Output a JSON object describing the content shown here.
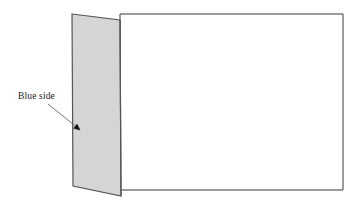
{
  "figure": {
    "type": "line-diagram",
    "canvas": {
      "width": 360,
      "height": 210,
      "background": "#ffffff"
    },
    "colors": {
      "background": "#ffffff",
      "panel_fill": "#d5d5d5",
      "panel_stroke": "#555555",
      "sheet_fill": "#ffffff",
      "sheet_stroke": "#3a3a3a",
      "leader_line": "#6b6b6b",
      "arrow_head": "#101010",
      "text": "#1a1a1a"
    },
    "shapes": {
      "sheet": {
        "name": "right-sheet",
        "description": "Large white rectangle lying flat",
        "points": "120,14 343,14 343,190 120,190",
        "fill": "#ffffff",
        "stroke": "#3a3a3a",
        "stroke_width": 1
      },
      "panel": {
        "name": "left-panel",
        "description": "Shaded upright flap hinged along the right edge",
        "points": "72,14 120,20 121,196 73,186",
        "fill": "#d5d5d5",
        "stroke": "#555555",
        "stroke_width": 1.2
      },
      "hinge": {
        "name": "hinge-fold-line",
        "description": "Fold line where panel meets sheet",
        "x1": 120,
        "y1": 20,
        "x2": 121,
        "y2": 196,
        "stroke": "#555555",
        "stroke_width": 1.2
      }
    },
    "annotations": [
      {
        "id": "blue-side",
        "label": "Blue side",
        "label_x": 18,
        "label_y": 92,
        "font_size": 9.5,
        "leader": {
          "x1": 48,
          "y1": 104,
          "x2": 78.5,
          "y2": 128.5
        },
        "arrow_head": {
          "x": 80,
          "y": 130,
          "size": 6.5,
          "angle_deg": 39
        }
      }
    ]
  }
}
